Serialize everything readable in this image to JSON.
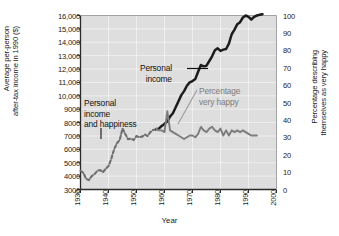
{
  "chart_data": {
    "type": "line",
    "title": "",
    "subtitle": "",
    "xlabel": "Year",
    "ylabel_left": "Average per-person after-tax income in 1990 ($)",
    "ylabel_left_line1": "Average per-person",
    "ylabel_left_line2": "after-tax income in 1990 ($)",
    "ylabel_right": "Percentage describing themselves as very happy",
    "ylabel_right_line1": "Percentage describing",
    "ylabel_right_line2": "themselves as very happy",
    "xlim": [
      1930,
      2000
    ],
    "xticks": [
      "1930",
      "1940",
      "1950",
      "1960",
      "1970",
      "1980",
      "1990",
      "2000"
    ],
    "ylim_left": [
      3000,
      16000
    ],
    "yticks_left": [
      "16,000",
      "15,000",
      "14,000",
      "13,000",
      "12,000",
      "11,000",
      "10,000",
      "9000",
      "8000",
      "7000",
      "6000",
      "5000",
      "4000",
      "3000"
    ],
    "ylim_right": [
      0,
      100
    ],
    "yticks_right": [
      "100",
      "90",
      "80",
      "70",
      "60",
      "50",
      "40",
      "30",
      "20",
      "10",
      "0"
    ],
    "grid": true,
    "legend_position": "inline-annotations",
    "annotations": [
      {
        "id": "personal-income",
        "text": "Personal\nincome",
        "line1": "Personal",
        "line2": "income",
        "color": "#111111"
      },
      {
        "id": "personal-income-and-happiness",
        "text": "Personal income and happiness",
        "line1": "Personal",
        "line2": "income",
        "line3": "and happiness",
        "color": "#111111"
      },
      {
        "id": "percentage-very-happy",
        "text": "Percentage very happy",
        "line1": "Percentage",
        "line2": "very happy",
        "color": "#7d7d7d"
      }
    ],
    "series": [
      {
        "name": "Personal income and happiness (combined, pre-1957)",
        "axis": "left",
        "color": "#6e6e6e",
        "style": "dashed",
        "x": [
          1930,
          1931,
          1932,
          1933,
          1934,
          1935,
          1936,
          1937,
          1938,
          1939,
          1940,
          1941,
          1942,
          1943,
          1944,
          1945,
          1946,
          1947,
          1948,
          1949,
          1950,
          1951,
          1952,
          1953,
          1954,
          1955,
          1956,
          1957
        ],
        "values": [
          4400,
          4250,
          3800,
          3700,
          4000,
          4150,
          4400,
          4450,
          4300,
          4550,
          4750,
          5300,
          6000,
          6450,
          6700,
          7550,
          7150,
          6750,
          6800,
          6700,
          7000,
          6900,
          6950,
          7100,
          7000,
          7300,
          7450,
          7500
        ]
      },
      {
        "name": "Personal income",
        "axis": "left",
        "color": "#1c1c1c",
        "style": "solid",
        "x": [
          1957,
          1958,
          1959,
          1960,
          1961,
          1962,
          1963,
          1964,
          1965,
          1966,
          1967,
          1968,
          1969,
          1970,
          1971,
          1972,
          1973,
          1974,
          1975,
          1976,
          1977,
          1978,
          1979,
          1980,
          1981,
          1982,
          1983,
          1984,
          1985,
          1986,
          1987,
          1988,
          1989,
          1990,
          1991,
          1992,
          1993,
          1994,
          1995
        ],
        "values": [
          7500,
          7550,
          7750,
          7900,
          8100,
          8450,
          8700,
          9150,
          9600,
          10050,
          10350,
          10750,
          11000,
          11100,
          11250,
          11800,
          12300,
          12200,
          12250,
          12600,
          12950,
          13400,
          13550,
          13350,
          13450,
          13500,
          13900,
          14600,
          14950,
          15350,
          15500,
          15850,
          16000,
          15900,
          15700,
          15900,
          16000,
          16050,
          16100
        ]
      },
      {
        "name": "Percentage very happy",
        "axis": "right",
        "color": "#7d7d7d",
        "style": "solid",
        "x": [
          1957,
          1958,
          1959,
          1960,
          1961,
          1962,
          1963,
          1964,
          1965,
          1966,
          1967,
          1968,
          1969,
          1970,
          1971,
          1972,
          1973,
          1974,
          1975,
          1976,
          1977,
          1978,
          1979,
          1980,
          1981,
          1982,
          1983,
          1984,
          1985,
          1986,
          1987,
          1988,
          1989,
          1990,
          1991,
          1992,
          1993
        ],
        "values": [
          35,
          34,
          34,
          33,
          45,
          34,
          33,
          32,
          31,
          30,
          29,
          30,
          31,
          31,
          30,
          32,
          36,
          34,
          33,
          35,
          36,
          34,
          33,
          35,
          31,
          34,
          31,
          34,
          33,
          34,
          33,
          34,
          33,
          32,
          31,
          31,
          31
        ]
      }
    ]
  },
  "style": {
    "plot_background": "#dedede",
    "grid_color": "#f2f2f2",
    "axis_color": "#2a2a2a",
    "income_color": "#1c1c1c",
    "happy_color": "#7d7d7d",
    "dashed_color": "#6e6e6e",
    "text_color": "#1a1a1a"
  }
}
